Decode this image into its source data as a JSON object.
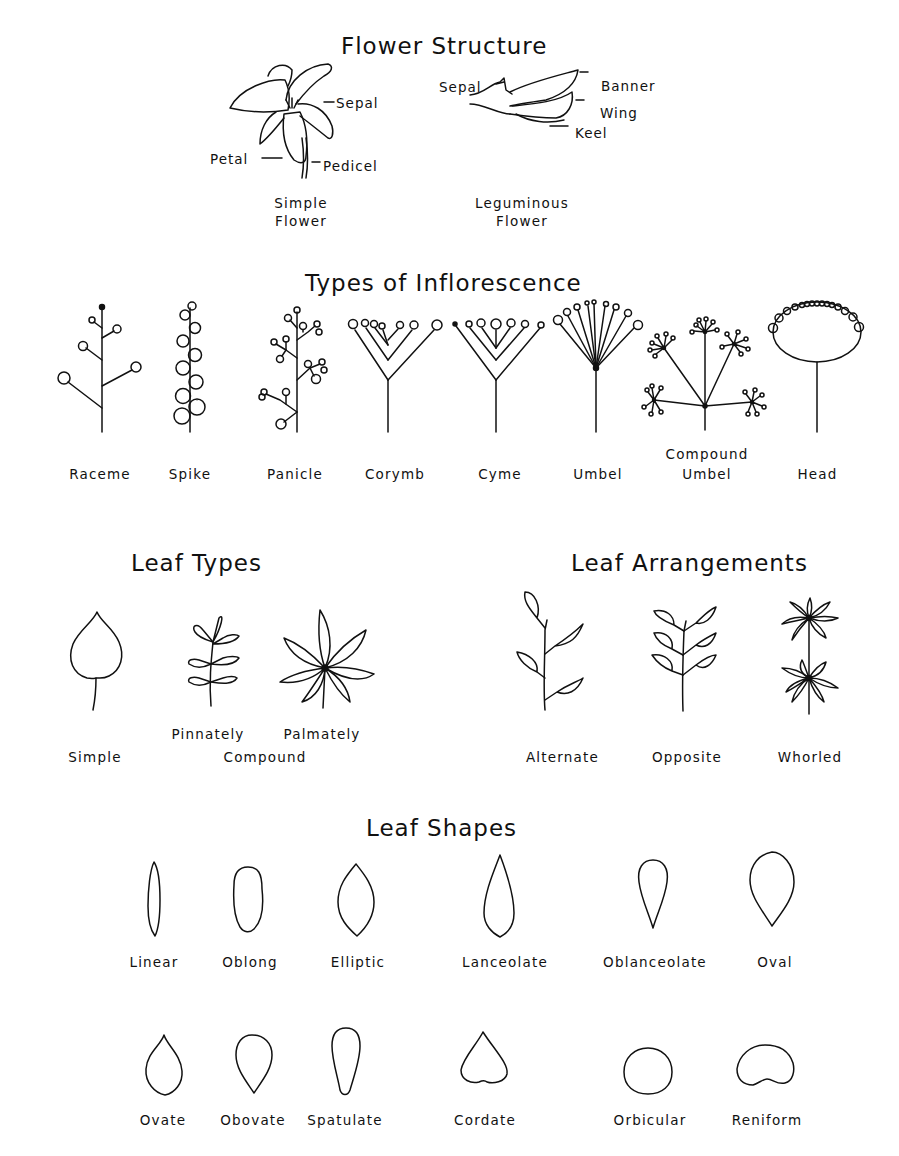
{
  "flower_structure": {
    "title": "Flower Structure",
    "simple": {
      "caption_line1": "Simple",
      "caption_line2": "Flower",
      "parts": {
        "sepal": "Sepal",
        "petal": "Petal",
        "pedicel": "Pedicel"
      }
    },
    "leguminous": {
      "caption_line1": "Leguminous",
      "caption_line2": "Flower",
      "parts": {
        "sepal": "Sepal",
        "banner": "Banner",
        "wing": "Wing",
        "keel": "Keel"
      }
    }
  },
  "inflorescence": {
    "title": "Types of Inflorescence",
    "items": [
      {
        "label": "Raceme"
      },
      {
        "label": "Spike"
      },
      {
        "label": "Panicle"
      },
      {
        "label": "Corymb"
      },
      {
        "label": "Cyme"
      },
      {
        "label": "Umbel"
      },
      {
        "label_line1": "Compound",
        "label_line2": "Umbel"
      },
      {
        "label": "Head"
      }
    ]
  },
  "leaf_types": {
    "title": "Leaf Types",
    "simple": "Simple",
    "pinnately": "Pinnately",
    "palmately": "Palmately",
    "compound": "Compound"
  },
  "leaf_arrangements": {
    "title": "Leaf Arrangements",
    "items": [
      {
        "label": "Alternate"
      },
      {
        "label": "Opposite"
      },
      {
        "label": "Whorled"
      }
    ]
  },
  "leaf_shapes": {
    "title": "Leaf Shapes",
    "row1": [
      {
        "label": "Linear"
      },
      {
        "label": "Oblong"
      },
      {
        "label": "Elliptic"
      },
      {
        "label": "Lanceolate"
      },
      {
        "label": "Oblanceolate"
      },
      {
        "label": "Oval"
      }
    ],
    "row2": [
      {
        "label": "Ovate"
      },
      {
        "label": "Obovate"
      },
      {
        "label": "Spatulate"
      },
      {
        "label": "Cordate"
      },
      {
        "label": "Orbicular"
      },
      {
        "label": "Reniform"
      }
    ]
  }
}
